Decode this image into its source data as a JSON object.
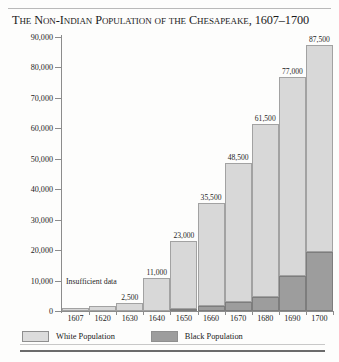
{
  "chart_data": {
    "type": "bar",
    "title": "The Non-Indian Population of the Chesapeake, 1607–1700",
    "xlabel": "",
    "ylabel": "Population",
    "ylim": [
      0,
      90000
    ],
    "ytick_step": 10000,
    "grid": false,
    "stacked": true,
    "legend_position": "bottom-left",
    "categories": [
      "1607",
      "1620",
      "1630",
      "1640",
      "1650",
      "1660",
      "1670",
      "1680",
      "1690",
      "1700"
    ],
    "yticks": [
      "0",
      "10,000",
      "20,000",
      "30,000",
      "40,000",
      "50,000",
      "60,000",
      "70,000",
      "80,000",
      "90,000"
    ],
    "series": [
      {
        "name": "White Population",
        "color": "#d8d8d8",
        "values": [
          900,
          1800,
          2500,
          11000,
          22300,
          33800,
          45500,
          57000,
          65500,
          68000
        ],
        "labels": [
          "",
          "",
          "2,500",
          "11,000",
          "23,000",
          "35,500",
          "48,500",
          "61,500",
          "77,000",
          "87,500"
        ],
        "label_note": "labels show the total (white + black) population at each date"
      },
      {
        "name": "Black Population",
        "color": "#9d9d9d",
        "values": [
          0,
          0,
          0,
          0,
          700,
          1700,
          3000,
          4500,
          11500,
          19500
        ],
        "labels": [
          "",
          "",
          "",
          "",
          "700",
          "1,700",
          "3,000",
          "4,500",
          "11,500",
          "19,500"
        ]
      }
    ],
    "totals": [
      null,
      null,
      2500,
      11000,
      23000,
      35500,
      48500,
      61500,
      77000,
      87500
    ],
    "annotations": [
      {
        "text": "Insufficient data",
        "applies_to": [
          "1607",
          "1620"
        ],
        "note": "no separate white/black breakdown available for 1607 and 1620"
      }
    ]
  },
  "legend": {
    "items": [
      {
        "label": "White Population",
        "swatch": "white-swatch"
      },
      {
        "label": "Black Population",
        "swatch": "black-swatch"
      }
    ]
  },
  "axis": {
    "y_title": "Population"
  },
  "annotation": {
    "insufficient_data": "Insufficient data"
  }
}
